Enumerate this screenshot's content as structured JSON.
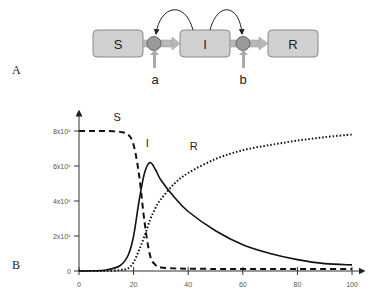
{
  "panel_a": {
    "label": "A",
    "compartments": [
      {
        "id": "S",
        "label": "S"
      },
      {
        "id": "I",
        "label": "I"
      },
      {
        "id": "R",
        "label": "R"
      }
    ],
    "rates": [
      {
        "label": "a"
      },
      {
        "label": "b"
      }
    ],
    "colors": {
      "box_fill": "#d0d0d0",
      "box_stroke": "#888888",
      "node_fill": "#9a9a9a",
      "arrow_fill": "#b8b8b8"
    }
  },
  "panel_b": {
    "label": "B"
  },
  "chart_data": {
    "type": "line",
    "title": "",
    "xlabel": "",
    "ylabel": "",
    "xlim": [
      0,
      100
    ],
    "ylim": [
      0,
      8000000
    ],
    "x_ticks": [
      "0",
      "20",
      "40",
      "60",
      "80",
      "100"
    ],
    "y_ticks": [
      "0",
      "2x10⁶",
      "4x10⁶",
      "6x10⁶",
      "8x10⁶"
    ],
    "grid": false,
    "x": [
      0,
      5,
      10,
      15,
      18,
      20,
      22,
      24,
      26,
      28,
      30,
      35,
      40,
      50,
      60,
      70,
      80,
      90,
      100
    ],
    "series": [
      {
        "name": "S",
        "style": "dashed",
        "values": [
          8000000,
          8000000,
          8000000,
          7950000,
          7800000,
          7200000,
          5500000,
          2800000,
          900000,
          350000,
          200000,
          150000,
          130000,
          120000,
          120000,
          120000,
          120000,
          120000,
          120000
        ]
      },
      {
        "name": "I",
        "style": "solid",
        "values": [
          0,
          10000,
          60000,
          300000,
          900000,
          2000000,
          4000000,
          5600000,
          6200000,
          5800000,
          5200000,
          4200000,
          3400000,
          2300000,
          1500000,
          1000000,
          650000,
          420000,
          350000
        ]
      },
      {
        "name": "R",
        "style": "dotted",
        "values": [
          0,
          0,
          10000,
          50000,
          150000,
          500000,
          1200000,
          2000000,
          2900000,
          3600000,
          4100000,
          5000000,
          5600000,
          6400000,
          6900000,
          7200000,
          7450000,
          7650000,
          7800000
        ]
      }
    ],
    "annotations": [
      {
        "text": "S",
        "x": 14,
        "y": 8600000
      },
      {
        "text": "I",
        "x": 25,
        "y": 7100000
      },
      {
        "text": "R",
        "x": 42,
        "y": 6900000
      }
    ]
  }
}
